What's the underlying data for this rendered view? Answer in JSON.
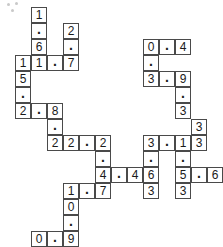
{
  "puzzle": {
    "title": "number-crossword-grid",
    "cell_size_px": 16,
    "origin": {
      "x": 15,
      "y": 7
    },
    "grid_columns": 11,
    "grid_rows": 14,
    "colors": {
      "background": "#ffffff",
      "cell_fill": "#ffffff",
      "cell_border": "#4a4a4a",
      "digit": "#1a1a1a"
    },
    "cells": [
      {
        "col": 1,
        "row": 0,
        "value": "1"
      },
      {
        "col": 1,
        "row": 1,
        "value": "."
      },
      {
        "col": 3,
        "row": 1,
        "value": "2"
      },
      {
        "col": 1,
        "row": 2,
        "value": "6"
      },
      {
        "col": 3,
        "row": 2,
        "value": "."
      },
      {
        "col": 0,
        "row": 3,
        "value": "1"
      },
      {
        "col": 1,
        "row": 3,
        "value": "1"
      },
      {
        "col": 2,
        "row": 3,
        "value": "."
      },
      {
        "col": 3,
        "row": 3,
        "value": "7"
      },
      {
        "col": 0,
        "row": 4,
        "value": "5"
      },
      {
        "col": 0,
        "row": 5,
        "value": "."
      },
      {
        "col": 0,
        "row": 6,
        "value": "2"
      },
      {
        "col": 1,
        "row": 6,
        "value": "."
      },
      {
        "col": 2,
        "row": 6,
        "value": "8"
      },
      {
        "col": 2,
        "row": 7,
        "value": "."
      },
      {
        "col": 2,
        "row": 8,
        "value": "2"
      },
      {
        "col": 3,
        "row": 8,
        "value": "2"
      },
      {
        "col": 4,
        "row": 8,
        "value": "."
      },
      {
        "col": 5,
        "row": 8,
        "value": "2"
      },
      {
        "col": 5,
        "row": 9,
        "value": "."
      },
      {
        "col": 5,
        "row": 10,
        "value": "4"
      },
      {
        "col": 6,
        "row": 10,
        "value": "."
      },
      {
        "col": 7,
        "row": 10,
        "value": "4"
      },
      {
        "col": 8,
        "row": 10,
        "value": "6"
      },
      {
        "col": 8,
        "row": 8,
        "value": "3"
      },
      {
        "col": 9,
        "row": 8,
        "value": "."
      },
      {
        "col": 10,
        "row": 8,
        "value": "1"
      },
      {
        "col": 8,
        "row": 9,
        "value": "."
      },
      {
        "col": 8,
        "row": 11,
        "value": "3"
      },
      {
        "col": 3,
        "row": 11,
        "value": "1"
      },
      {
        "col": 4,
        "row": 11,
        "value": "."
      },
      {
        "col": 5,
        "row": 11,
        "value": "7"
      },
      {
        "col": 3,
        "row": 12,
        "value": "0"
      },
      {
        "col": 3,
        "row": 13,
        "value": "."
      },
      {
        "col": 1,
        "row": 14,
        "value": "0"
      },
      {
        "col": 2,
        "row": 14,
        "value": "."
      },
      {
        "col": 3,
        "row": 14,
        "value": "9"
      },
      {
        "col": 8,
        "row": 2,
        "value": "0"
      },
      {
        "col": 9,
        "row": 2,
        "value": "."
      },
      {
        "col": 10,
        "row": 2,
        "value": "4"
      },
      {
        "col": 8,
        "row": 3,
        "value": "."
      },
      {
        "col": 8,
        "row": 4,
        "value": "3"
      },
      {
        "col": 9,
        "row": 4,
        "value": "."
      },
      {
        "col": 10,
        "row": 4,
        "value": "9"
      },
      {
        "col": 10,
        "row": 5,
        "value": "."
      },
      {
        "col": 10,
        "row": 6,
        "value": "3"
      },
      {
        "col": 10,
        "row": 7,
        "value": "3"
      },
      {
        "col": 11,
        "row": 10,
        "value": "."
      },
      {
        "col": 10,
        "row": 9,
        "value": "."
      },
      {
        "col": 10,
        "row": 10,
        "value": "5"
      },
      {
        "col": 11,
        "row": 100,
        "value": ""
      }
    ],
    "cells_final": [
      {
        "col": 1,
        "row": 0,
        "value": "1",
        "name": "cell-c1-r0"
      },
      {
        "col": 1,
        "row": 1,
        "value": ".",
        "name": "cell-c1-r1"
      },
      {
        "col": 3,
        "row": 1,
        "value": "2",
        "name": "cell-c3-r1"
      },
      {
        "col": 1,
        "row": 2,
        "value": "6",
        "name": "cell-c1-r2"
      },
      {
        "col": 3,
        "row": 2,
        "value": ".",
        "name": "cell-c3-r2"
      },
      {
        "col": 0,
        "row": 3,
        "value": "1",
        "name": "cell-c0-r3"
      },
      {
        "col": 1,
        "row": 3,
        "value": "1",
        "name": "cell-c1-r3"
      },
      {
        "col": 2,
        "row": 3,
        "value": ".",
        "name": "cell-c2-r3"
      },
      {
        "col": 3,
        "row": 3,
        "value": "7",
        "name": "cell-c3-r3"
      },
      {
        "col": 0,
        "row": 4,
        "value": "5",
        "name": "cell-c0-r4"
      },
      {
        "col": 0,
        "row": 5,
        "value": ".",
        "name": "cell-c0-r5"
      },
      {
        "col": 0,
        "row": 6,
        "value": "2",
        "name": "cell-c0-r6"
      },
      {
        "col": 1,
        "row": 6,
        "value": ".",
        "name": "cell-c1-r6"
      },
      {
        "col": 2,
        "row": 6,
        "value": "8",
        "name": "cell-c2-r6"
      },
      {
        "col": 2,
        "row": 7,
        "value": ".",
        "name": "cell-c2-r7"
      },
      {
        "col": 2,
        "row": 8,
        "value": "2",
        "name": "cell-c2-r8"
      },
      {
        "col": 3,
        "row": 8,
        "value": "2",
        "name": "cell-c3-r8"
      },
      {
        "col": 4,
        "row": 8,
        "value": ".",
        "name": "cell-c4-r8"
      },
      {
        "col": 5,
        "row": 8,
        "value": "2",
        "name": "cell-c5-r8"
      },
      {
        "col": 5,
        "row": 9,
        "value": ".",
        "name": "cell-c5-r9"
      },
      {
        "col": 5,
        "row": 10,
        "value": "4",
        "name": "cell-c5-r10"
      },
      {
        "col": 6,
        "row": 10,
        "value": ".",
        "name": "cell-c6-r10"
      },
      {
        "col": 7,
        "row": 10,
        "value": "4",
        "name": "cell-c7-r10"
      },
      {
        "col": 8,
        "row": 10,
        "value": "6",
        "name": "cell-c8-r10"
      },
      {
        "col": 8,
        "row": 8,
        "value": "3",
        "name": "cell-c8-r8"
      },
      {
        "col": 9,
        "row": 8,
        "value": ".",
        "name": "cell-c9-r8"
      },
      {
        "col": 10,
        "row": 8,
        "value": "1",
        "name": "cell-c10-r8"
      },
      {
        "col": 11,
        "row": 8,
        "value": "3",
        "name": "cell-c11-r8"
      },
      {
        "col": 8,
        "row": 9,
        "value": ".",
        "name": "cell-c8-r9"
      },
      {
        "col": 8,
        "row": 11,
        "value": "3",
        "name": "cell-c8-r11"
      },
      {
        "col": 10,
        "row": 9,
        "value": ".",
        "name": "cell-c10-r9"
      },
      {
        "col": 10,
        "row": 10,
        "value": "5",
        "name": "cell-c10-r10"
      },
      {
        "col": 11,
        "row": 10,
        "value": ".",
        "name": "cell-c11-r10"
      },
      {
        "col": 12,
        "row": 10,
        "value": "6",
        "name": "cell-c12-r10"
      },
      {
        "col": 10,
        "row": 11,
        "value": "3",
        "name": "cell-c10-r11"
      },
      {
        "col": 3,
        "row": 11,
        "value": "1",
        "name": "cell-c3-r11"
      },
      {
        "col": 4,
        "row": 11,
        "value": ".",
        "name": "cell-c4-r11"
      },
      {
        "col": 5,
        "row": 11,
        "value": "7",
        "name": "cell-c5-r11"
      },
      {
        "col": 3,
        "row": 12,
        "value": "0",
        "name": "cell-c3-r12"
      },
      {
        "col": 3,
        "row": 13,
        "value": ".",
        "name": "cell-c3-r13"
      },
      {
        "col": 1,
        "row": 14,
        "value": "0",
        "name": "cell-c1-r14"
      },
      {
        "col": 2,
        "row": 14,
        "value": ".",
        "name": "cell-c2-r14"
      },
      {
        "col": 3,
        "row": 14,
        "value": "9",
        "name": "cell-c3-r14"
      },
      {
        "col": 8,
        "row": 2,
        "value": "0",
        "name": "cell-c8-r2"
      },
      {
        "col": 9,
        "row": 2,
        "value": ".",
        "name": "cell-c9-r2"
      },
      {
        "col": 10,
        "row": 2,
        "value": "4",
        "name": "cell-c10-r2"
      },
      {
        "col": 8,
        "row": 3,
        "value": ".",
        "name": "cell-c8-r3"
      },
      {
        "col": 8,
        "row": 4,
        "value": "3",
        "name": "cell-c8-r4"
      },
      {
        "col": 9,
        "row": 4,
        "value": ".",
        "name": "cell-c9-r4"
      },
      {
        "col": 10,
        "row": 4,
        "value": "9",
        "name": "cell-c10-r4"
      },
      {
        "col": 10,
        "row": 5,
        "value": ".",
        "name": "cell-c10-r5"
      },
      {
        "col": 10,
        "row": 6,
        "value": "3",
        "name": "cell-c10-r6"
      },
      {
        "col": 11,
        "row": 7,
        "value": "3",
        "name": "cell-c11-r7"
      }
    ],
    "entries": [
      {
        "name": "entry-11-7",
        "text": "11.7"
      },
      {
        "name": "entry-1-6",
        "text": "1.6"
      },
      {
        "name": "entry-2-7",
        "text": "2.7"
      },
      {
        "name": "entry-15-2",
        "text": "15.2"
      },
      {
        "name": "entry-2-8",
        "text": "2.8"
      },
      {
        "name": "entry-8-22",
        "text": "8.22"
      },
      {
        "name": "entry-22-2",
        "text": "22.2"
      },
      {
        "name": "entry-2-4",
        "text": "2.4"
      },
      {
        "name": "entry-4-4",
        "text": "4.4"
      },
      {
        "name": "entry-4-7",
        "text": "4.7"
      },
      {
        "name": "entry-1-7",
        "text": "1.7"
      },
      {
        "name": "entry-10-9",
        "text": "10.9"
      },
      {
        "name": "entry-0-9",
        "text": "0.9"
      },
      {
        "name": "entry-0-4",
        "text": "0.4"
      },
      {
        "name": "entry-0-3",
        "text": "0.3"
      },
      {
        "name": "entry-3-9",
        "text": "3.9"
      },
      {
        "name": "entry-9-33",
        "text": "9.33"
      },
      {
        "name": "entry-3-13",
        "text": "3.13"
      },
      {
        "name": "entry-3-63",
        "text": "3.63"
      },
      {
        "name": "entry-1-53",
        "text": "1.53"
      },
      {
        "name": "entry-5-6",
        "text": "5.6"
      }
    ]
  },
  "speckles": [
    {
      "x": 7,
      "y": 3
    },
    {
      "x": 15,
      "y": 2
    },
    {
      "x": 11,
      "y": 9
    }
  ]
}
